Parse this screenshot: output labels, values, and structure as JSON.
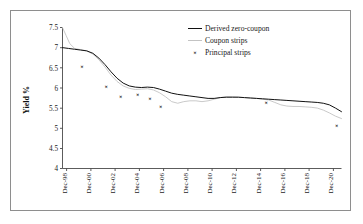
{
  "figure": {
    "frame_color": "#8e8e8e",
    "background": "#ffffff"
  },
  "chart_data": {
    "type": "line",
    "title": "",
    "xlabel": "",
    "ylabel": "Yield %",
    "ylim": [
      4,
      7.5
    ],
    "ytick_values": [
      4,
      4.5,
      5,
      5.5,
      6,
      6.5,
      7,
      7.5
    ],
    "ytick_labels": [
      "4",
      "4.5",
      "5",
      "5.5",
      "6",
      "6.5",
      "7",
      "7.5"
    ],
    "xlim": [
      1998,
      2021
    ],
    "xtick_labels": [
      "Dec-98",
      "Dec-00",
      "Dec-02",
      "Dec-04",
      "Dec-06",
      "Dec-08",
      "Dec-10",
      "Dec-12",
      "Dec-14",
      "Dec-16",
      "Dec-18",
      "Dec-20"
    ],
    "xtick_values": [
      1998,
      2000,
      2002,
      2004,
      2006,
      2008,
      2010,
      2012,
      2014,
      2016,
      2018,
      2020
    ],
    "grid": false,
    "legend_position": "top-right",
    "series": [
      {
        "name": "Derived zero-coupon",
        "style": "line",
        "color": "#111111",
        "x": [
          1998.0,
          1998.5,
          1999.0,
          1999.5,
          2000.0,
          2000.5,
          2001.0,
          2001.5,
          2002.0,
          2002.5,
          2003.0,
          2003.5,
          2004.0,
          2004.5,
          2005.0,
          2005.5,
          2006.0,
          2006.5,
          2007.0,
          2007.5,
          2008.0,
          2008.5,
          2009.0,
          2009.5,
          2010.0,
          2010.5,
          2011.0,
          2011.5,
          2012.0,
          2012.5,
          2013.0,
          2013.5,
          2014.0,
          2014.5,
          2015.0,
          2015.5,
          2016.0,
          2016.5,
          2017.0,
          2017.5,
          2018.0,
          2018.5,
          2019.0,
          2019.5,
          2020.0,
          2020.5,
          2021.0
        ],
        "y": [
          7.0,
          6.98,
          6.96,
          6.94,
          6.92,
          6.86,
          6.74,
          6.58,
          6.4,
          6.24,
          6.12,
          6.05,
          6.02,
          6.01,
          6.02,
          6.01,
          5.97,
          5.92,
          5.87,
          5.84,
          5.82,
          5.8,
          5.78,
          5.76,
          5.74,
          5.74,
          5.76,
          5.77,
          5.77,
          5.77,
          5.76,
          5.75,
          5.74,
          5.73,
          5.72,
          5.71,
          5.7,
          5.69,
          5.68,
          5.67,
          5.66,
          5.65,
          5.64,
          5.62,
          5.58,
          5.5,
          5.41
        ]
      },
      {
        "name": "Coupon strips",
        "style": "line",
        "color": "#c3c3c3",
        "x": [
          1998.0,
          1998.3,
          1998.6,
          1999.0,
          1999.5,
          2000.0,
          2000.5,
          2001.0,
          2001.5,
          2002.0,
          2002.5,
          2003.0,
          2003.5,
          2004.0,
          2004.5,
          2005.0,
          2005.5,
          2006.0,
          2006.5,
          2007.0,
          2007.5,
          2008.0,
          2008.5,
          2009.0,
          2009.5,
          2010.0,
          2010.5,
          2011.0,
          2011.5,
          2012.0,
          2012.5,
          2013.0,
          2013.5,
          2014.0,
          2014.5,
          2015.0,
          2015.5,
          2016.0,
          2016.5,
          2017.0,
          2017.5,
          2018.0,
          2018.5,
          2019.0,
          2019.5,
          2020.0,
          2020.5,
          2021.0
        ],
        "y": [
          7.5,
          7.3,
          7.1,
          6.98,
          6.95,
          6.92,
          6.84,
          6.7,
          6.52,
          6.32,
          6.16,
          6.05,
          5.99,
          5.96,
          5.97,
          5.98,
          5.95,
          5.88,
          5.78,
          5.66,
          5.62,
          5.66,
          5.68,
          5.68,
          5.66,
          5.68,
          5.72,
          5.76,
          5.78,
          5.78,
          5.77,
          5.76,
          5.75,
          5.74,
          5.72,
          5.7,
          5.64,
          5.58,
          5.55,
          5.54,
          5.54,
          5.53,
          5.52,
          5.5,
          5.45,
          5.38,
          5.3,
          5.24
        ]
      },
      {
        "name": "Principal strips",
        "style": "scatter",
        "marker": "x",
        "color": "#111111",
        "x": [
          1999.6,
          2001.6,
          2002.8,
          2004.2,
          2005.2,
          2006.1,
          2014.8,
          2020.6
        ],
        "y": [
          6.52,
          6.02,
          5.77,
          5.82,
          5.74,
          5.53,
          5.63,
          5.07
        ]
      }
    ],
    "legend": [
      {
        "label": "Derived zero-coupon",
        "marker": "line",
        "color": "#111111"
      },
      {
        "label": "Coupon strips",
        "marker": "line",
        "color": "#c3c3c3"
      },
      {
        "label": "Principal strips",
        "marker": "x",
        "color": "#111111"
      }
    ]
  }
}
